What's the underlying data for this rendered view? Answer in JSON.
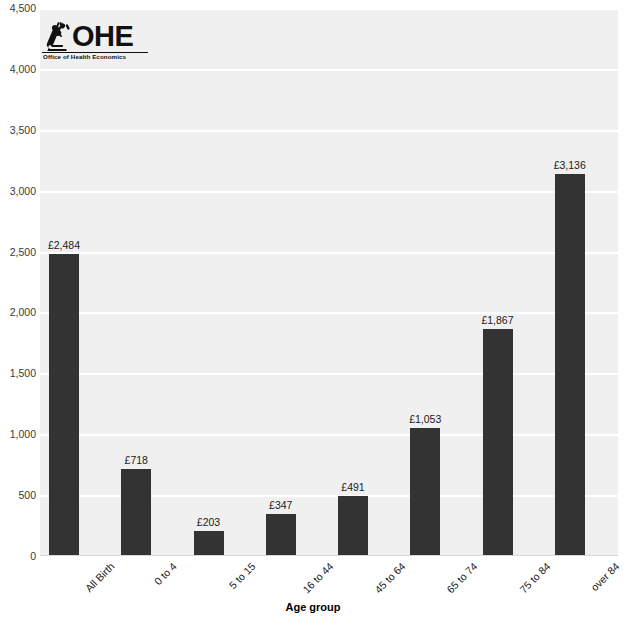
{
  "logo": {
    "name": "ohe-logo",
    "wordmark": "OHE",
    "subtitle": "Office of Health Economics",
    "mark": "microscope-icon"
  },
  "chart_data": {
    "type": "bar",
    "title": "",
    "xlabel": "Age group",
    "ylabel": "",
    "categories": [
      "All Birth",
      "0 to 4",
      "5 to 15",
      "16 to 44",
      "45 to 64",
      "65 to 74",
      "75 to 84",
      "over 84"
    ],
    "values": [
      2484,
      718,
      203,
      347,
      491,
      1053,
      1867,
      3136
    ],
    "value_labels": [
      "£2,484",
      "£718",
      "£203",
      "£347",
      "£491",
      "£1,053",
      "£1,867",
      "£3,136"
    ],
    "ylim": [
      0,
      4500
    ],
    "yticks": [
      0,
      500,
      1000,
      1500,
      2000,
      2500,
      3000,
      3500,
      4000,
      4500
    ],
    "ytick_labels": [
      "0",
      "500",
      "1,000",
      "1,500",
      "2,000",
      "2,500",
      "3,000",
      "3,500",
      "4,000",
      "4,500"
    ],
    "grid": true,
    "legend": "none",
    "bar_color": "#333333",
    "plot_background": "#f0f0f0",
    "gridline_color": "#ffffff"
  }
}
